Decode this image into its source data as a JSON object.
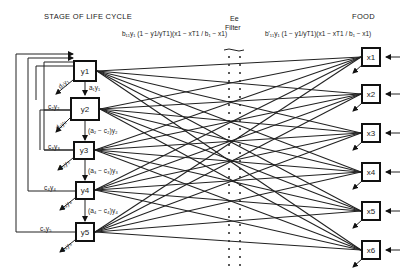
{
  "headers": {
    "stage": "STAGE OF LIFE CYCLE",
    "food": "FOOD",
    "filter_top": "Ee",
    "filter_label": "Filter",
    "left_formula": "b₁₁y₁ (1 − y1/yT1)(x1 − xT1 / b₁ − x1)",
    "right_formula": "b'₁₁y₁ (1 − y1/yT1)(x1 − xT1 / b₁ − x1)"
  },
  "stages": [
    {
      "id": "y1",
      "label": "y1",
      "loss": "d₁y₁",
      "transfer": "a₁y₁"
    },
    {
      "id": "y2",
      "label": "y2",
      "loss": "d₂y₂",
      "feedback": "c₂y₂",
      "transfer": "(a₂ − c₂)y₂"
    },
    {
      "id": "y3",
      "label": "y3",
      "loss": "d₃y₃",
      "feedback": "c₃y₃",
      "transfer": "(a₃ − c₃)y₃"
    },
    {
      "id": "y4",
      "label": "y4",
      "loss": "d₄y₄",
      "feedback": "c₄y₄",
      "transfer": "(a₄ − c₄)y₄"
    },
    {
      "id": "y5",
      "label": "y5",
      "loss": "d₅y₅",
      "feedback": "c₅y₅"
    }
  ],
  "foods": [
    {
      "id": "x1",
      "label": "x1"
    },
    {
      "id": "x2",
      "label": "x2"
    },
    {
      "id": "x3",
      "label": "x3"
    },
    {
      "id": "x4",
      "label": "x4"
    },
    {
      "id": "x5",
      "label": "x5"
    },
    {
      "id": "x6",
      "label": "x6"
    }
  ]
}
